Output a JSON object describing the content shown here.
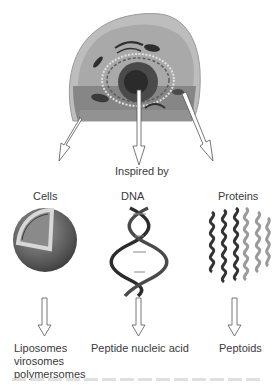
{
  "diagram": {
    "source_label": "Inspired by",
    "branches": [
      {
        "source": "Cells",
        "result_lines": [
          "Liposomes",
          "virosomes",
          "polymersomes"
        ]
      },
      {
        "source": "DNA",
        "result_lines": [
          "Peptide nucleic acid"
        ]
      },
      {
        "source": "Proteins",
        "result_lines": [
          "Peptoids"
        ]
      }
    ],
    "icons": {
      "top": "eukaryotic-cell-illustration",
      "branch_0": "lipid-vesicle-sphere",
      "branch_1": "dna-double-helix",
      "branch_2": "protein-helix-bundle"
    },
    "colors": {
      "cell_outer": "#b9b9b9",
      "cell_inner": "#a5a5a5",
      "cell_lower": "#7d7d7d",
      "nucleus": "#3a3a3a",
      "arrow_stroke": "#555555",
      "text": "#3a3a3a"
    }
  }
}
